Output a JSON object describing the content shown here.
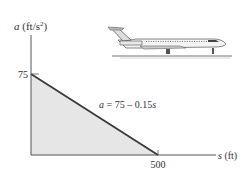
{
  "chart_data": {
    "type": "area",
    "title": "",
    "equation_label_parts": {
      "var": "a",
      "rest": " = 75 – 0.15",
      "var2": "s"
    },
    "ylabel": {
      "var": "a",
      "unit": " (ft/s",
      "sup": "2",
      "close": ")"
    },
    "xlabel": {
      "var": "s",
      "unit": " (ft)"
    },
    "x": [
      0,
      500
    ],
    "y": [
      75,
      0
    ],
    "xlim": [
      0,
      650
    ],
    "ylim": [
      0,
      105
    ],
    "xticks": [
      {
        "value": 500,
        "label": "500"
      }
    ],
    "yticks": [
      {
        "value": 75,
        "label": "75"
      }
    ],
    "equation": "a = 75 − 0.15s",
    "grid": false,
    "legend": "none",
    "fill_color": "#e6e6e6",
    "line_color": "#3a3a3a",
    "axis_color": "#555555"
  },
  "illustration": {
    "subject": "jet-airplane-on-runway"
  }
}
